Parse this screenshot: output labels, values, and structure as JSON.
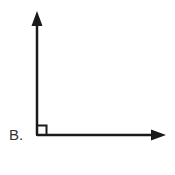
{
  "figure": {
    "label": "B.",
    "angle_marker": "right-angle-square",
    "colors": {
      "stroke": "#1a1a1a",
      "label": "#333333",
      "background": "#ffffff"
    }
  }
}
